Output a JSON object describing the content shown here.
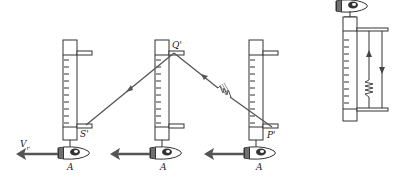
{
  "figure": {
    "type": "physics-diagram",
    "colors": {
      "ink": "#333333",
      "ray": "#555555",
      "arrow": "#555555"
    }
  },
  "labels": {
    "velocity": "V",
    "velocity_sub": "r",
    "mirror_start": "S'",
    "mirror_top": "Q'",
    "mirror_end": "P'",
    "observer_1": "A",
    "observer_2": "A",
    "observer_3": "A"
  },
  "clocks": [
    {
      "name": "clock-position-1",
      "x": 63,
      "label_bottom": "S'"
    },
    {
      "name": "clock-position-2",
      "x": 157,
      "label_top": "Q'"
    },
    {
      "name": "clock-position-3",
      "x": 250,
      "label_bottom": "P'"
    },
    {
      "name": "clock-rest-frame",
      "x": 343
    }
  ],
  "light_path": {
    "segments": [
      {
        "from": "P'",
        "to": "Q'",
        "has_wave_packet": true
      },
      {
        "from": "Q'",
        "to": "S'",
        "has_wave_packet": false
      }
    ]
  }
}
